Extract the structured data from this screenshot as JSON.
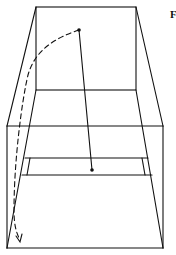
{
  "figure": {
    "label": "F",
    "stroke_color": "#111111",
    "background": "#ffffff"
  },
  "elements": {
    "back_wall": "rectangle",
    "floor_plank": "horizontal bar",
    "pendulum": {
      "top_point": "dot",
      "bottom_point": "dot"
    },
    "trajectory": "dashed curve with arrow"
  }
}
